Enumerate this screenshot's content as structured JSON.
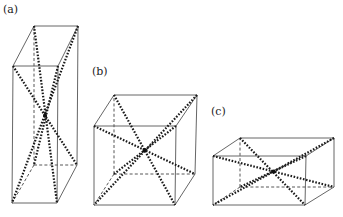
{
  "figure": {
    "panels": [
      {
        "id": "a",
        "label": "(a)",
        "label_pos": [
          3,
          4
        ],
        "shape": "tall rectangular box",
        "vertices": {
          "front_top_left": [
            13,
            66
          ],
          "front_top_right": [
            58,
            66
          ],
          "front_bottom_left": [
            12,
            203
          ],
          "front_bottom_right": [
            57,
            203
          ],
          "back_top_left": [
            34,
            26
          ],
          "back_top_right": [
            78,
            26
          ],
          "back_bottom_left": [
            34,
            165
          ],
          "back_bottom_right": [
            77,
            165
          ]
        }
      },
      {
        "id": "b",
        "label": "(b)",
        "label_pos": [
          92,
          66
        ],
        "shape": "cube",
        "vertices": {
          "front_top_left": [
            94,
            126
          ],
          "front_top_right": [
            176,
            126
          ],
          "front_bottom_left": [
            94,
            205
          ],
          "front_bottom_right": [
            175,
            205
          ],
          "back_top_left": [
            114,
            95
          ],
          "back_top_right": [
            197,
            95
          ],
          "back_bottom_left": [
            114,
            174
          ],
          "back_bottom_right": [
            195,
            174
          ]
        }
      },
      {
        "id": "c",
        "label": "(c)",
        "label_pos": [
          211,
          106
        ],
        "shape": "flat rectangular box",
        "vertices": {
          "front_top_left": [
            213,
            156
          ],
          "front_top_right": [
            306,
            156
          ],
          "front_bottom_left": [
            213,
            205
          ],
          "front_bottom_right": [
            305,
            205
          ],
          "back_top_left": [
            240,
            138
          ],
          "back_top_right": [
            334,
            138
          ],
          "back_bottom_left": [
            240,
            187
          ],
          "back_bottom_right": [
            334,
            187
          ]
        }
      }
    ],
    "style": {
      "visible_edges": "solid",
      "hidden_edges": "dashed",
      "body_diagonals": "dotted",
      "edge_color": "#555555",
      "diagonal_color": "#1a1a1a"
    }
  }
}
